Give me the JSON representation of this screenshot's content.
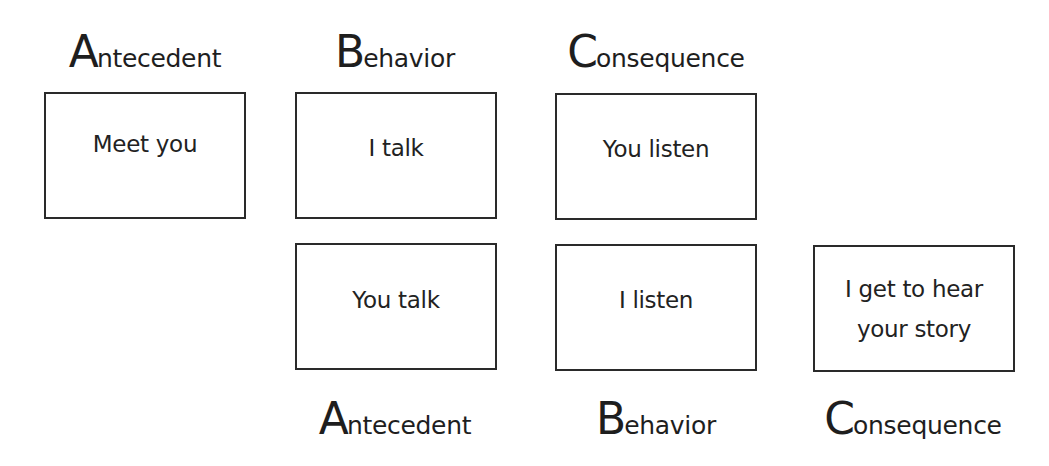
{
  "diagram": {
    "type": "ABC behavior chain",
    "top_row": {
      "labels": [
        {
          "cap": "A",
          "rest": "ntecedent"
        },
        {
          "cap": "B",
          "rest": "ehavior"
        },
        {
          "cap": "C",
          "rest": "onsequence"
        }
      ],
      "boxes": [
        {
          "role": "antecedent",
          "text": "Meet you"
        },
        {
          "role": "behavior",
          "text": "I talk"
        },
        {
          "role": "consequence",
          "text": "You listen"
        }
      ]
    },
    "bottom_row": {
      "boxes": [
        {
          "role": "antecedent",
          "text": "You talk"
        },
        {
          "role": "behavior",
          "text": "I listen"
        },
        {
          "role": "consequence",
          "line1": "I get to hear",
          "line2": "your story"
        }
      ],
      "labels": [
        {
          "cap": "A",
          "rest": "ntecedent"
        },
        {
          "cap": "B",
          "rest": "ehavior"
        },
        {
          "cap": "C",
          "rest": "onsequence"
        }
      ]
    },
    "colors": {
      "stroke": "#2a2a2a",
      "text": "#1e1e1e",
      "background": "#ffffff"
    }
  }
}
